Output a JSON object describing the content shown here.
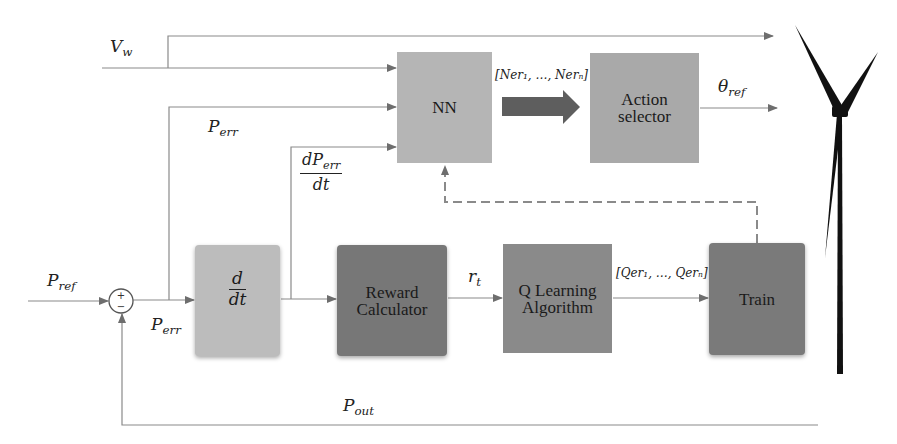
{
  "diagram": {
    "type": "control-block-diagram",
    "colors": {
      "wire": "#888888",
      "nn": "#b5b5b5",
      "action_selector": "#a9a9a9",
      "derivative": "#bcbcbc",
      "reward_calculator": "#777777",
      "q_learning": "#8a8a8a",
      "train": "#7a7a7a",
      "big_arrow": "#5e5e5e",
      "turbine": "#111111"
    },
    "blocks": {
      "nn": {
        "label": "NN"
      },
      "action_selector": {
        "label_line1": "Action",
        "label_line2": "selector"
      },
      "derivative": {
        "numerator": "d",
        "denominator": "dt"
      },
      "reward_calculator": {
        "label_line1": "Reward",
        "label_line2": "Calculator"
      },
      "q_learning": {
        "label_line1": "Q Learning",
        "label_line2": "Algorithm"
      },
      "train": {
        "label": "Train"
      }
    },
    "summing_junction": {
      "plus": "+",
      "minus": "−"
    },
    "signals": {
      "v_w": {
        "base": "V",
        "sub": "w"
      },
      "p_ref": {
        "base": "P",
        "sub": "ref"
      },
      "p_err_top": {
        "base": "P",
        "sub": "err"
      },
      "p_err_bottom": {
        "base": "P",
        "sub": "err"
      },
      "dp_err_dt": {
        "numerator_base": "dP",
        "numerator_sub": "err",
        "denominator": "dt"
      },
      "nn_output": "[Ner₁, …, Nerₙ]",
      "theta_ref": {
        "base": "θ",
        "sub": "ref"
      },
      "r_t": {
        "base": "r",
        "sub": "t"
      },
      "q_output": "[Qer₁, …, Qerₙ]",
      "p_out": {
        "base": "P",
        "sub": "out"
      }
    },
    "icons": {
      "wind_turbine": "wind-turbine-icon"
    }
  }
}
